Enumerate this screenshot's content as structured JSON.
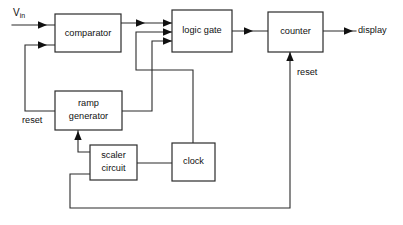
{
  "diagram": {
    "type": "block-diagram",
    "background_color": "#ffffff",
    "line_color": "#2b2b2b",
    "text_color": "#111111",
    "blocks": [
      {
        "id": "comparator",
        "label": "comparator",
        "x": 55,
        "y": 14,
        "w": 66,
        "h": 38
      },
      {
        "id": "logic-gate",
        "label": "logic gate",
        "x": 172,
        "y": 10,
        "w": 60,
        "h": 42
      },
      {
        "id": "counter",
        "label": "counter",
        "x": 268,
        "y": 12,
        "w": 55,
        "h": 40
      },
      {
        "id": "ramp-generator",
        "label": "ramp",
        "label2": "generator",
        "x": 55,
        "y": 91,
        "w": 67,
        "h": 39
      },
      {
        "id": "scaler-circuit",
        "label": "scaler",
        "label2": "circuit",
        "x": 90,
        "y": 145,
        "w": 47,
        "h": 35
      },
      {
        "id": "clock",
        "label": "clock",
        "x": 172,
        "y": 143,
        "w": 43,
        "h": 38
      }
    ],
    "signals": {
      "input_label": "V",
      "input_subscript": "in",
      "output_label": "display",
      "reset_left_label": "reset",
      "reset_right_label": "reset"
    },
    "connections": [
      {
        "from": "Vin",
        "to": "comparator",
        "label": ""
      },
      {
        "from": "comparator",
        "to": "logic-gate",
        "label": ""
      },
      {
        "from": "clock",
        "to": "logic-gate",
        "label": ""
      },
      {
        "from": "ramp-generator",
        "to": "logic-gate",
        "label": ""
      },
      {
        "from": "logic-gate",
        "to": "counter",
        "label": ""
      },
      {
        "from": "counter",
        "to": "display",
        "label": ""
      },
      {
        "from": "ramp-generator",
        "to": "comparator",
        "label": "reset"
      },
      {
        "from": "scaler-circuit",
        "to": "ramp-generator",
        "label": ""
      },
      {
        "from": "scaler-circuit",
        "to": "clock",
        "label": ""
      },
      {
        "from": "scaler-circuit",
        "to": "counter",
        "label": "reset"
      }
    ]
  }
}
